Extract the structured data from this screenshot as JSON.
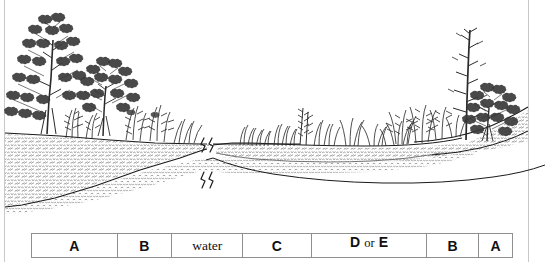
{
  "figure": {
    "kind": "riparian-cross-section-illustration",
    "ink_color": "#1a1a1a",
    "paper_color": "#ffffff",
    "break_marks": 2
  },
  "legend": {
    "cells": [
      {
        "text": "A",
        "style": "bold",
        "width": 86
      },
      {
        "text": "B",
        "style": "bold",
        "width": 55
      },
      {
        "text": "water",
        "style": "serif",
        "width": 71
      },
      {
        "text": "C",
        "style": "bold",
        "width": 69
      },
      {
        "text": "D or E",
        "style": "mixed",
        "width": 116,
        "parts": [
          "D",
          "or",
          "E"
        ]
      },
      {
        "text": "B",
        "style": "bold",
        "width": 52
      },
      {
        "text": "A",
        "style": "bold",
        "width": 33
      }
    ]
  }
}
